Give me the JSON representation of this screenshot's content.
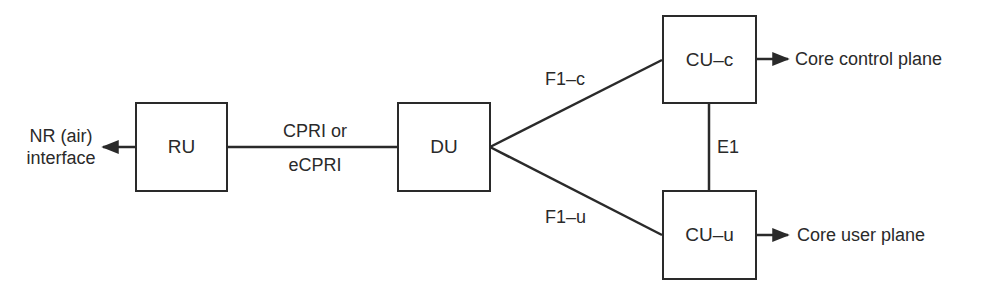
{
  "diagram": {
    "type": "block-diagram",
    "nodes": {
      "ru": {
        "label": "RU"
      },
      "du": {
        "label": "DU"
      },
      "cu_c": {
        "label": "CU–c"
      },
      "cu_u": {
        "label": "CU–u"
      }
    },
    "edges": {
      "ru_du": {
        "label_top": "CPRI or",
        "label_bottom": "eCPRI"
      },
      "du_cuc": {
        "label": "F1–c"
      },
      "du_cuu": {
        "label": "F1–u"
      },
      "cuc_cuu": {
        "label": "E1"
      }
    },
    "outputs": {
      "air": {
        "line1": "NR (air)",
        "line2": "interface"
      },
      "control": {
        "label": "Core control plane"
      },
      "user": {
        "label": "Core user plane"
      }
    },
    "colors": {
      "stroke": "#2a2a2a",
      "background": "#ffffff"
    }
  }
}
